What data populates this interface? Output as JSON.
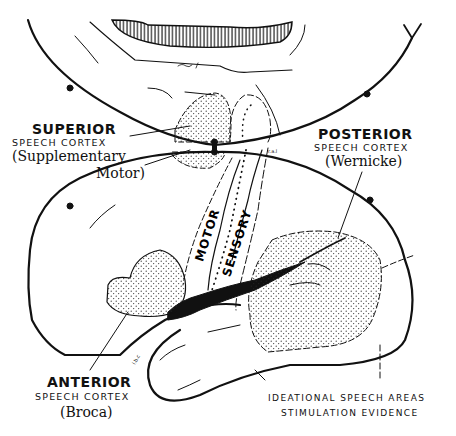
{
  "diagram": {
    "type": "anatomical-illustration",
    "colors": {
      "ink": "#111111",
      "background": "#ffffff"
    }
  },
  "labels": {
    "superior": {
      "title": "SUPERIOR",
      "subtitle": "SPEECH CORTEX",
      "note_line1": "(Supplementary",
      "note_line2": "Motor)"
    },
    "posterior": {
      "title": "POSTERIOR",
      "subtitle": "SPEECH CORTEX",
      "note": "(Wernicke)"
    },
    "anterior": {
      "title": "ANTERIOR",
      "subtitle": "SPEECH CORTEX",
      "note": "(Broca)"
    },
    "strip": {
      "motor": "MOTOR",
      "sensory": "SENSORY"
    },
    "caption": {
      "line1": "IDEATIONAL SPEECH AREAS",
      "line2": "STIMULATION EVIDENCE"
    }
  }
}
